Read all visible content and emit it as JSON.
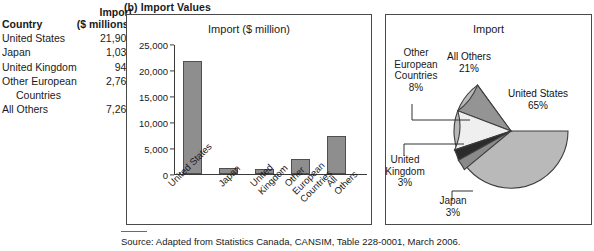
{
  "section": {
    "header": "(b) Import Values"
  },
  "table": {
    "header_country": "Country",
    "header_import_line1": "Import",
    "header_import_line2": "($ millions)",
    "rows": [
      {
        "country": "United States",
        "value": "21,906",
        "indent": false
      },
      {
        "country": "Japan",
        "value": "1,039",
        "indent": false
      },
      {
        "country": "United Kingdom",
        "value": "942",
        "indent": false
      },
      {
        "country": "Other European",
        "value": "2,763",
        "indent": false
      },
      {
        "country": "Countries",
        "value": "",
        "indent": true
      },
      {
        "country": "All Others",
        "value": "7,263",
        "indent": false
      }
    ]
  },
  "bar_chart": {
    "title": "Import ($ million)",
    "ytick_labels": [
      "25,000",
      "20,000",
      "15,000",
      "10,000",
      "5,000",
      "0"
    ],
    "xlabels": [
      [
        "United States"
      ],
      [
        "Japan"
      ],
      [
        "United",
        "Kingdom"
      ],
      [
        "Other",
        "European",
        "Countries"
      ],
      [
        "All",
        "Others"
      ]
    ]
  },
  "pie_chart": {
    "title": "Import",
    "labels": {
      "united_states": {
        "name": "United States",
        "pct": "65%"
      },
      "all_others": {
        "name": "All Others",
        "pct": "21%"
      },
      "other_european": {
        "name_l1": "Other",
        "name_l2": "European",
        "name_l3": "Countries",
        "pct": "8%"
      },
      "united_kingdom": {
        "name_l1": "United",
        "name_l2": "Kingdom",
        "pct": "3%"
      },
      "japan": {
        "name": "Japan",
        "pct": "3%"
      }
    }
  },
  "footer": {
    "source": "Source: Adapted from Statistics Canada, CANSIM, Table 228-0001, March 2006."
  },
  "colors": {
    "bar_fill": "#8e8e8e",
    "bar_stroke": "#4f4f4f",
    "panel_border": "#4a4a4a",
    "slice_united_states": "#b9b9b9",
    "slice_all_others": "#949494",
    "slice_other_european": "#efefef",
    "slice_united_kingdom": "#2b2b2b",
    "slice_japan": "#8a8a8a",
    "slice_stroke": "#3d3d3d"
  },
  "chart_data": [
    {
      "type": "bar",
      "title": "Import ($ million)",
      "categories": [
        "United States",
        "Japan",
        "United Kingdom",
        "Other European Countries",
        "All Others"
      ],
      "values": [
        21906,
        1039,
        942,
        2763,
        7263
      ],
      "xlabel": "",
      "ylabel": "",
      "ylim": [
        0,
        25000
      ],
      "yticks": [
        0,
        5000,
        10000,
        15000,
        20000,
        25000
      ],
      "grid": false,
      "legend": "none",
      "units": "$ million"
    },
    {
      "type": "pie",
      "title": "Import",
      "categories": [
        "United States",
        "All Others",
        "Other European Countries",
        "United Kingdom",
        "Japan"
      ],
      "values": [
        65,
        21,
        8,
        3,
        3
      ],
      "value_labels": [
        "65%",
        "21%",
        "8%",
        "3%",
        "3%"
      ],
      "start_angle_deg": 0,
      "direction": "counterclockwise",
      "legend": "none",
      "units": "percent"
    },
    {
      "type": "table",
      "columns": [
        "Country",
        "Import ($ millions)"
      ],
      "rows": [
        [
          "United States",
          "21,906"
        ],
        [
          "Japan",
          "1,039"
        ],
        [
          "United Kingdom",
          "942"
        ],
        [
          "Other European Countries",
          "2,763"
        ],
        [
          "All Others",
          "7,263"
        ]
      ]
    }
  ]
}
